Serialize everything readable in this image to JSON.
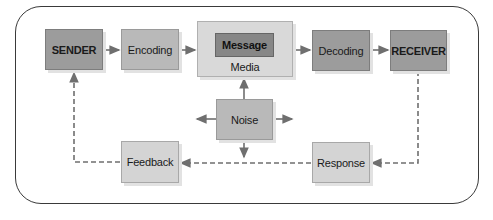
{
  "diagram": {
    "nodes": {
      "sender": {
        "label": "SENDER"
      },
      "encoding": {
        "label": "Encoding"
      },
      "media": {
        "label": "Media"
      },
      "message": {
        "label": "Message"
      },
      "decoding": {
        "label": "Decoding"
      },
      "receiver": {
        "label": "RECEIVER"
      },
      "noise": {
        "label": "Noise"
      },
      "feedback": {
        "label": "Feedback"
      },
      "response": {
        "label": "Response"
      }
    },
    "edges": [
      {
        "from": "SENDER",
        "to": "Encoding",
        "style": "solid"
      },
      {
        "from": "Encoding",
        "to": "Media",
        "style": "solid"
      },
      {
        "from": "Media",
        "to": "Decoding",
        "style": "solid"
      },
      {
        "from": "Decoding",
        "to": "RECEIVER",
        "style": "solid"
      },
      {
        "from": "Noise",
        "to": "Media",
        "style": "solid"
      },
      {
        "from": "Noise",
        "to": "left",
        "style": "solid"
      },
      {
        "from": "Noise",
        "to": "right",
        "style": "solid"
      },
      {
        "from": "Noise",
        "to": "down",
        "style": "solid"
      },
      {
        "from": "RECEIVER",
        "to": "Response",
        "style": "dashed"
      },
      {
        "from": "Response",
        "to": "Feedback",
        "style": "dashed"
      },
      {
        "from": "Feedback",
        "to": "SENDER",
        "style": "dashed"
      }
    ],
    "colors": {
      "frame": "#3a3a3a",
      "arrow": "#6f6f6f",
      "dark_box": "#9c9c9c",
      "message_box": "#878787",
      "light_box": "#d4d4d4"
    }
  }
}
